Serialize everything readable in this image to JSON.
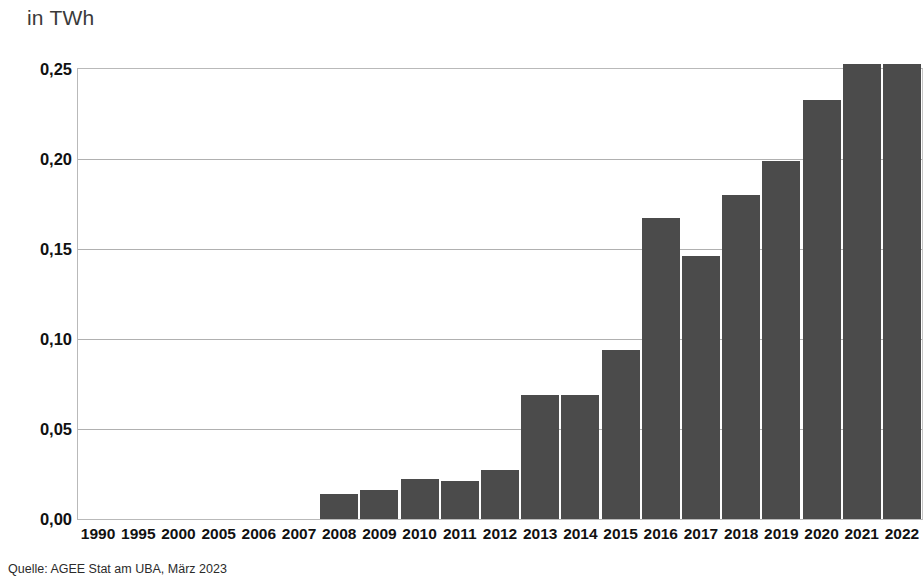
{
  "unit_title": "in TWh",
  "source_note": "Quelle: AGEE Stat am UBA, März 2023",
  "style": {
    "bar_color": "#4b4b4b",
    "gridline_color": "#b0b0b0",
    "plot_border_color": "#b9b9b9",
    "background_color": "#ffffff",
    "text_color": "#111111"
  },
  "chart_data": {
    "type": "bar",
    "title": "in TWh",
    "subtitle": "",
    "xlabel": "",
    "ylabel": "in TWh",
    "ylim": [
      0,
      0.25
    ],
    "ytick_values": [
      0.0,
      0.05,
      0.1,
      0.15,
      0.2,
      0.25
    ],
    "ytick_labels": [
      "0,00",
      "0,05",
      "0,10",
      "0,15",
      "0,20",
      "0,25"
    ],
    "grid": true,
    "legend": false,
    "legend_position": "none",
    "decimal_separator": ",",
    "categories": [
      "1990",
      "1995",
      "2000",
      "2005",
      "2006",
      "2007",
      "2008",
      "2009",
      "2010",
      "2011",
      "2012",
      "2013",
      "2014",
      "2015",
      "2016",
      "2017",
      "2018",
      "2019",
      "2020",
      "2021",
      "2022"
    ],
    "values": [
      0,
      0,
      0,
      0,
      0,
      0,
      0.014,
      0.016,
      0.022,
      0.021,
      0.027,
      0.069,
      0.069,
      0.094,
      0.167,
      0.146,
      0.18,
      0.199,
      0.233,
      0.253,
      0.253
    ],
    "series": [
      {
        "name": "Stromerzeugung",
        "values": [
          0,
          0,
          0,
          0,
          0,
          0,
          0.014,
          0.016,
          0.022,
          0.021,
          0.027,
          0.069,
          0.069,
          0.094,
          0.167,
          0.146,
          0.18,
          0.199,
          0.233,
          0.253,
          0.253
        ]
      }
    ],
    "annotations": []
  }
}
